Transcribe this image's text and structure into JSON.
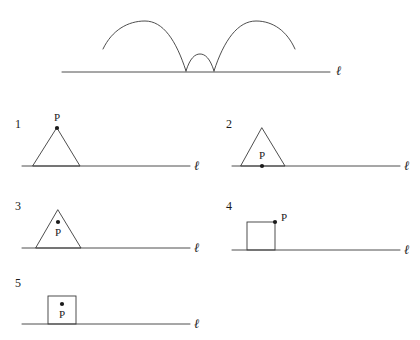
{
  "figure": {
    "background_color": "#ffffff",
    "stroke_color": "#3a3a3a",
    "line_label": "ℓ",
    "point_label": "P",
    "top_diagram": {
      "name": "traced-curve-diagram",
      "description_line_label": "ℓ",
      "arcs": [
        {
          "name": "left-large-arc"
        },
        {
          "name": "middle-small-arc"
        },
        {
          "name": "right-large-arc"
        }
      ]
    },
    "options": [
      {
        "number": "1",
        "shape": "triangle",
        "point_label": "P",
        "point_position": "apex"
      },
      {
        "number": "2",
        "shape": "triangle",
        "point_label": "P",
        "point_position": "base-midpoint"
      },
      {
        "number": "3",
        "shape": "triangle",
        "point_label": "P",
        "point_position": "interior"
      },
      {
        "number": "4",
        "shape": "square",
        "point_label": "P",
        "point_position": "top-right-corner"
      },
      {
        "number": "5",
        "shape": "square",
        "point_label": "P",
        "point_position": "interior"
      }
    ]
  }
}
